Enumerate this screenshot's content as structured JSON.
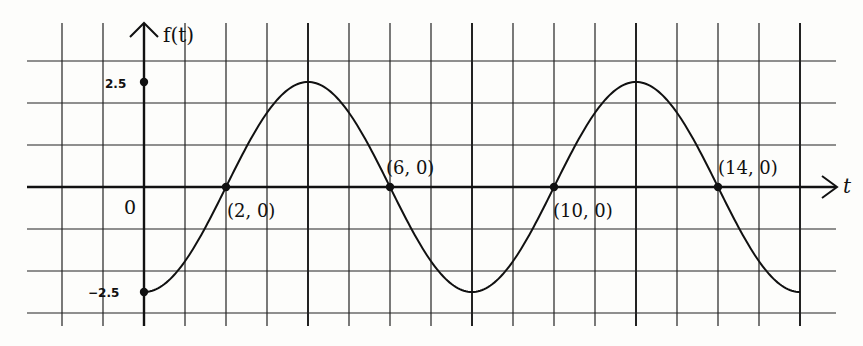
{
  "chart_data": {
    "type": "line",
    "title": "",
    "xlabel": "t",
    "ylabel": "f(t)",
    "function": "f(t) = -2.5 cos(pi t / 4)",
    "xlim": [
      -2.5,
      17
    ],
    "ylim": [
      -3,
      3.8
    ],
    "grid": true,
    "y_ticks": [
      {
        "value": 2.5,
        "label": "2.5"
      },
      {
        "value": -2.5,
        "label": "−2.5"
      }
    ],
    "origin_label": "0",
    "x": [
      0,
      2,
      4,
      6,
      8,
      10,
      12,
      14,
      16
    ],
    "series": [
      {
        "name": "f(t)",
        "values": [
          -2.5,
          0,
          2.5,
          0,
          -2.5,
          0,
          2.5,
          0,
          -2.5
        ]
      }
    ],
    "annotations": [
      {
        "t": 2,
        "y": 0,
        "label": "(2, 0)"
      },
      {
        "t": 6,
        "y": 0,
        "label": "(6, 0)"
      },
      {
        "t": 10,
        "y": 0,
        "label": "(10, 0)"
      },
      {
        "t": 14,
        "y": 0,
        "label": "(14, 0)"
      }
    ],
    "marked_points": [
      {
        "t": 0,
        "y": 2.5
      },
      {
        "t": 0,
        "y": -2.5
      }
    ]
  },
  "labels": {
    "y_axis": "f(t)",
    "x_axis": "t",
    "origin": "0",
    "tick_pos": "2.5",
    "tick_neg": "−2.5",
    "p1": "(2, 0)",
    "p2": "(6, 0)",
    "p3": "(10, 0)",
    "p4": "(14, 0)"
  }
}
